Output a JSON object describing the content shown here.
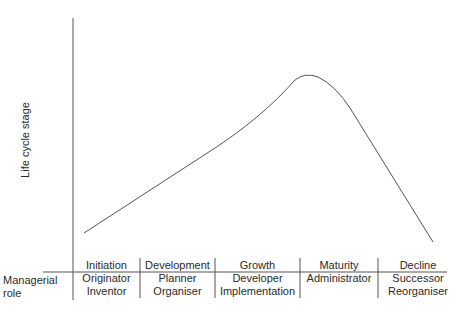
{
  "diagram": {
    "y_axis_label": "Life cycle stage",
    "row_label_line1": "Managerial",
    "row_label_line2": "role",
    "stages": [
      {
        "name": "Initiation",
        "roles": [
          "Originator",
          "Inventor"
        ]
      },
      {
        "name": "Development",
        "roles": [
          "Planner",
          "Organiser"
        ]
      },
      {
        "name": "Growth",
        "roles": [
          "Developer",
          "Implementation"
        ]
      },
      {
        "name": "Maturity",
        "roles": [
          "Administrator"
        ]
      },
      {
        "name": "Decline",
        "roles": [
          "Successor",
          "Reorganiser"
        ]
      }
    ],
    "curve_description": "Rises steadily from Initiation through Growth, peaks at start of Maturity, then declines steeply"
  }
}
